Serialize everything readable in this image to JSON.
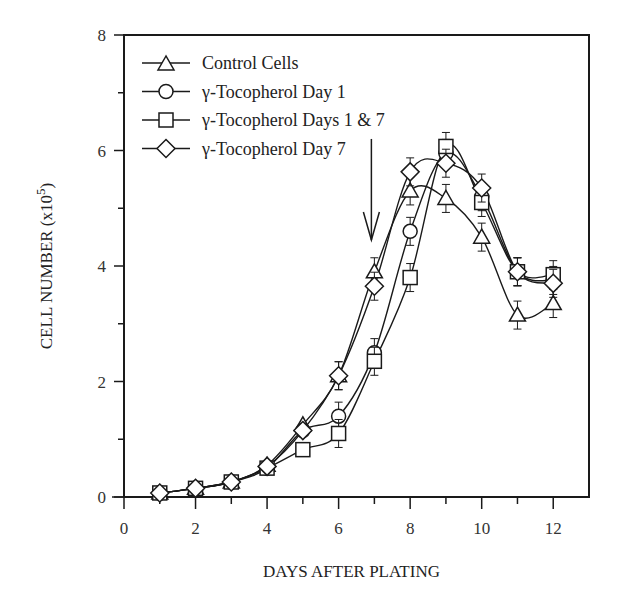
{
  "chart_data": {
    "type": "line",
    "title": "",
    "xlabel": "DAYS AFTER PLATING",
    "ylabel": "CELL NUMBER (x10^5)",
    "ylabel_main": "CELL NUMBER (x10",
    "ylabel_sup": "5",
    "ylabel_close": ")",
    "xlim": [
      0,
      13
    ],
    "ylim": [
      0,
      8
    ],
    "xticks": [
      0,
      2,
      4,
      6,
      8,
      10,
      12
    ],
    "yticks": [
      0,
      2,
      4,
      6,
      8
    ],
    "grid": false,
    "legend_position": "upper-left",
    "annotation": {
      "type": "arrow",
      "x": 7,
      "label": "",
      "from_y": 6.2,
      "to_y": 4.45
    },
    "x": [
      1,
      2,
      3,
      4,
      5,
      6,
      7,
      8,
      9,
      10,
      11,
      12
    ],
    "series": [
      {
        "name": "Control Cells",
        "marker": "triangle",
        "values": [
          0.07,
          0.15,
          0.26,
          0.55,
          1.25,
          2.1,
          3.9,
          5.3,
          5.17,
          4.5,
          3.15,
          3.35
        ]
      },
      {
        "name": "γ-Tocopherol Day 1",
        "marker": "circle",
        "values": [
          0.07,
          0.15,
          0.26,
          0.5,
          1.15,
          1.4,
          2.5,
          4.6,
          5.95,
          5.2,
          3.9,
          3.75
        ]
      },
      {
        "name": "γ-Tocopherol Days 1 & 7",
        "marker": "square",
        "values": [
          0.07,
          0.15,
          0.26,
          0.5,
          0.82,
          1.1,
          2.35,
          3.8,
          6.07,
          5.1,
          3.9,
          3.85
        ]
      },
      {
        "name": "γ-Tocopherol Day 7",
        "marker": "diamond",
        "values": [
          0.07,
          0.15,
          0.26,
          0.53,
          1.15,
          2.1,
          3.65,
          5.63,
          5.78,
          5.35,
          3.9,
          3.7
        ]
      }
    ]
  }
}
